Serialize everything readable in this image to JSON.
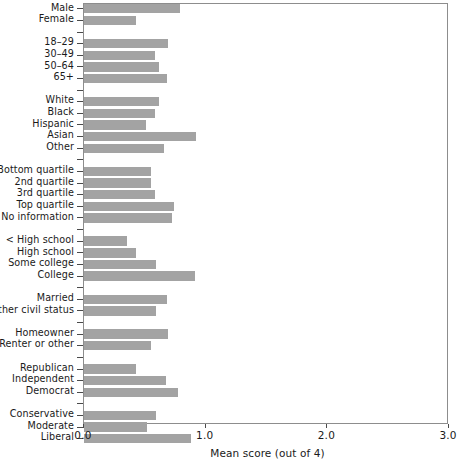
{
  "chart_data": {
    "type": "bar",
    "orientation": "horizontal",
    "title": "",
    "xlabel": "Mean score (out of 4)",
    "ylabel": "",
    "xlim": [
      0.0,
      3.0
    ],
    "xticks": [
      0.0,
      1.0,
      2.0,
      3.0
    ],
    "xtick_labels": [
      "0.0",
      "1.0",
      "2.0",
      "3.0"
    ],
    "grid": false,
    "legend": null,
    "bar_color": "#a3a3a3",
    "frame_color": "#8d8d8d",
    "groups": [
      {
        "name": "gender",
        "categories": [
          "Male",
          "Female"
        ],
        "values": [
          0.79,
          0.43
        ]
      },
      {
        "name": "age",
        "categories": [
          "18–29",
          "30–49",
          "50–64",
          "65+"
        ],
        "values": [
          0.69,
          0.58,
          0.62,
          0.68
        ]
      },
      {
        "name": "race",
        "categories": [
          "White",
          "Black",
          "Hispanic",
          "Asian",
          "Other"
        ],
        "values": [
          0.62,
          0.58,
          0.51,
          0.92,
          0.66
        ]
      },
      {
        "name": "income",
        "categories": [
          "Bottom quartile",
          "2nd quartile",
          "3rd quartile",
          "Top quartile",
          "No information"
        ],
        "values": [
          0.55,
          0.55,
          0.58,
          0.74,
          0.72
        ]
      },
      {
        "name": "education",
        "categories": [
          "< High school",
          "High school",
          "Some college",
          "College"
        ],
        "values": [
          0.35,
          0.43,
          0.59,
          0.91
        ]
      },
      {
        "name": "civil-status",
        "categories": [
          "Married",
          "Other civil status"
        ],
        "values": [
          0.68,
          0.59
        ]
      },
      {
        "name": "housing",
        "categories": [
          "Homeowner",
          "Renter or other"
        ],
        "values": [
          0.69,
          0.55
        ]
      },
      {
        "name": "party",
        "categories": [
          "Republican",
          "Independent",
          "Democrat"
        ],
        "values": [
          0.43,
          0.67,
          0.77
        ]
      },
      {
        "name": "ideology",
        "categories": [
          "Conservative",
          "Moderate",
          "Liberal"
        ],
        "values": [
          0.59,
          0.52,
          0.88
        ]
      }
    ]
  }
}
